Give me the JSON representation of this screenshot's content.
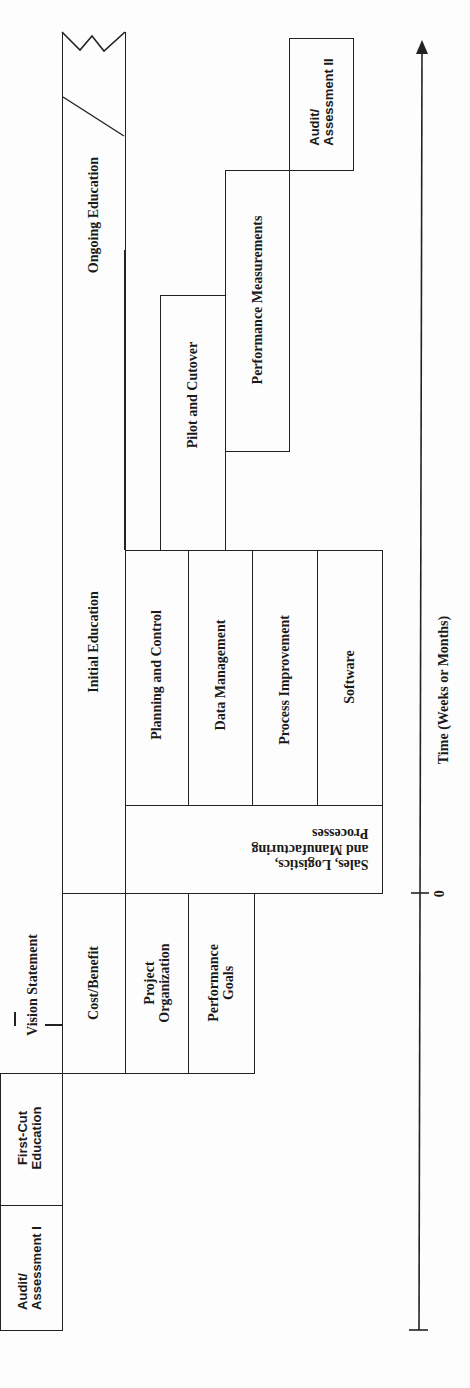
{
  "diagram": {
    "orientation": "rotated 90 degrees counter-clockwise; time flows upward",
    "phases": {
      "audit_assessment_1": "Audit/\nAssessment I",
      "first_cut_education": "First-Cut\nEducation",
      "vision_statement": "Vision Statement",
      "cost_benefit": "Cost/Benefit",
      "project_organization": "Project\nOrganization",
      "performance_goals": "Performance\nGoals",
      "initial_education": "Initial Education",
      "ongoing_education": "Ongoing Education",
      "sales_logistics": "Sales, Logistics,\nand Manufacturing\nProcesses",
      "planning_control": "Planning and Control",
      "data_management": "Data Management",
      "process_improvement": "Process Improvement",
      "software": "Software",
      "pilot_cutover": "Pilot and Cutover",
      "performance_measurements": "Performance Measurements",
      "audit_assessment_2": "Audit/\nAssessment II"
    },
    "axis": {
      "label": "Time (Weeks or Months)",
      "zero_tick": "0"
    }
  }
}
